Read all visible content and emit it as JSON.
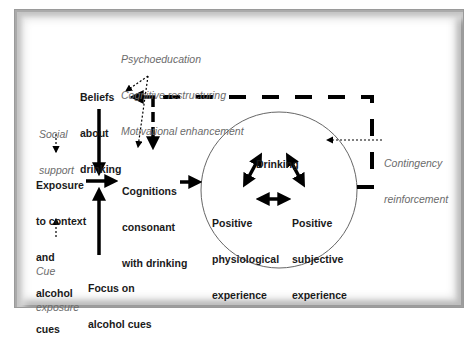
{
  "diagram": {
    "nodes": {
      "beliefs": {
        "lines": [
          "Beliefs",
          "about",
          "drinking"
        ]
      },
      "exposure": {
        "lines": [
          "Exposure",
          "to context",
          "and",
          "alcohol",
          "cues"
        ]
      },
      "cognitions": {
        "lines": [
          "Cognitions",
          "consonant",
          "with drinking"
        ]
      },
      "focus": {
        "lines": [
          "Focus on",
          "alcohol cues"
        ]
      },
      "drinking": {
        "lines": [
          "Drinking"
        ]
      },
      "physiological": {
        "lines": [
          "Positive",
          "physiological",
          "experience"
        ]
      },
      "subjective": {
        "lines": [
          "Positive",
          "subjective",
          "experience"
        ]
      }
    },
    "interventions": {
      "cognitive": {
        "lines": [
          "Psychoeducation",
          "Cognitive restructuring",
          "Motivational enhancement"
        ]
      },
      "social": {
        "lines": [
          "Social",
          "support"
        ]
      },
      "cue": {
        "lines": [
          "Cue",
          "exposure"
        ]
      },
      "contingency": {
        "lines": [
          "Contingency",
          "reinforcement"
        ]
      }
    },
    "colors": {
      "arrow": "#000000",
      "intervention_text": "#6b6b6b",
      "circle_stroke": "#666666",
      "frame": "#9a9a9a"
    },
    "edges": [
      {
        "from": "beliefs",
        "to": "cognitions",
        "style": "solid"
      },
      {
        "from": "exposure",
        "to": "cognitions",
        "style": "solid"
      },
      {
        "from": "focus",
        "to": "cognitions",
        "style": "solid"
      },
      {
        "from": "cognitions",
        "to": "drinking-cycle",
        "style": "solid"
      },
      {
        "from": "drinking-cycle",
        "to": "beliefs",
        "style": "dashed"
      },
      {
        "from": "drinking-cycle",
        "to": "cognitions",
        "style": "dashed"
      },
      {
        "from": "drinking",
        "to": "physiological",
        "style": "bidirectional"
      },
      {
        "from": "drinking",
        "to": "subjective",
        "style": "bidirectional"
      },
      {
        "from": "physiological",
        "to": "subjective",
        "style": "bidirectional"
      },
      {
        "from": "cognitive-interventions",
        "to": "beliefs",
        "style": "dotted"
      },
      {
        "from": "cognitive-interventions",
        "to": "cognitions",
        "style": "dotted"
      },
      {
        "from": "social",
        "to": "exposure",
        "style": "dotted"
      },
      {
        "from": "cue",
        "to": "exposure",
        "style": "dotted"
      },
      {
        "from": "contingency",
        "to": "drinking",
        "style": "dotted"
      }
    ]
  }
}
